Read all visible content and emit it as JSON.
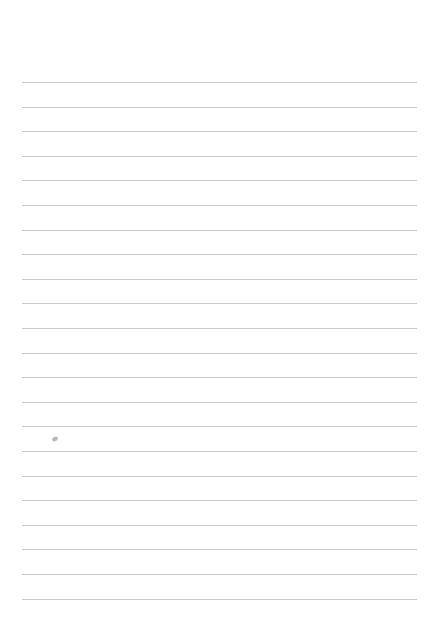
{
  "page": {
    "type": "lined-paper",
    "line_color": "#c9c9c9",
    "line_count": 22,
    "first_line_y": 82,
    "line_spacing": 24.6,
    "left": 22,
    "right": 417,
    "mark": {
      "x": 52,
      "y": 437
    }
  }
}
